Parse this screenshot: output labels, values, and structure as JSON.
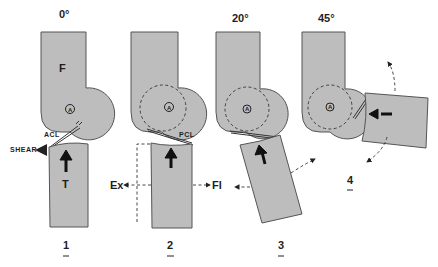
{
  "figure": {
    "panels": [
      {
        "number": "1",
        "angle": "0°",
        "ligament": "ACL",
        "force_label": "SHEAR",
        "femur_label": "F",
        "tibia_label": "T",
        "center_marker": "A"
      },
      {
        "number": "2",
        "angle": "",
        "ligament": "PCL",
        "left_label": "Ex",
        "right_label": "Fl",
        "center_marker": "A"
      },
      {
        "number": "3",
        "angle": "20°",
        "center_marker": "A"
      },
      {
        "number": "4",
        "angle": "45°",
        "center_marker": "A"
      }
    ]
  }
}
